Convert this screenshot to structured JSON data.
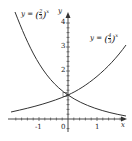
{
  "diagram": {
    "title": "",
    "axes": {
      "x_label": "x",
      "y_label": "y",
      "x_ticks": [
        {
          "value": -1,
          "label": "-1"
        },
        {
          "value": 0,
          "label": "0"
        },
        {
          "value": 1,
          "label": "1"
        }
      ],
      "y_ticks": [
        {
          "value": 2,
          "label": "2"
        },
        {
          "value": 3,
          "label": "3"
        },
        {
          "value": 4,
          "label": "4"
        }
      ]
    },
    "curves": [
      {
        "name": "decreasing-exponential",
        "label_prefix": "y = ",
        "base_numerator": "2",
        "base_denominator": "3",
        "exponent": "x",
        "base": 0.6667
      },
      {
        "name": "increasing-exponential",
        "label_prefix": "y = ",
        "base_numerator": "4",
        "base_denominator": "3",
        "exponent": "x",
        "base": 1.3333
      }
    ],
    "intersection": {
      "x": 0,
      "y": 1
    },
    "colors": {
      "curve": "#333333",
      "axis": "#333333",
      "text": "#222222"
    }
  }
}
